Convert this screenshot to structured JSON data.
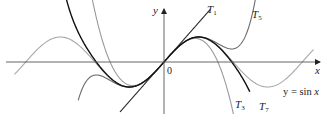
{
  "chart_data": {
    "type": "line",
    "title": "",
    "xlabel": "x",
    "ylabel": "y",
    "origin_label": "0",
    "xlim": [
      -7.3,
      7.0
    ],
    "ylim": [
      -2.1,
      2.2
    ],
    "grid": false,
    "legend": "inline labels",
    "series": [
      {
        "name": "y = sin x",
        "label": "y = sin x",
        "function": "sin(x)",
        "color": "#a8a8a8",
        "domain": [
          -6.8,
          6.8
        ]
      },
      {
        "name": "T1",
        "label": "T1",
        "function": "x",
        "color": "#2a2a2a",
        "domain": [
          -2.0,
          2.1
        ]
      },
      {
        "name": "T3",
        "label": "T3",
        "function": "x - x^3/6",
        "color": "#9a9a9a",
        "domain": [
          -4.2,
          3.2
        ]
      },
      {
        "name": "T5",
        "label": "T5",
        "function": "x - x^3/6 + x^5/120",
        "color": "#6a6a6a",
        "domain": [
          -3.9,
          4.3
        ]
      },
      {
        "name": "T7",
        "label": "T7",
        "function": "x - x^3/6 + x^5/120 - x^7/5040",
        "color": "#111111",
        "domain": [
          -4.9,
          3.9
        ]
      }
    ]
  },
  "labels": {
    "y_axis": "y",
    "x_axis": "x",
    "origin": "0",
    "T1": "T",
    "T1_sub": "1",
    "T3": "T",
    "T3_sub": "3",
    "T5": "T",
    "T5_sub": "5",
    "T7": "T",
    "T7_sub": "7",
    "sin_prefix": "y = sin ",
    "sin_var": "x"
  }
}
